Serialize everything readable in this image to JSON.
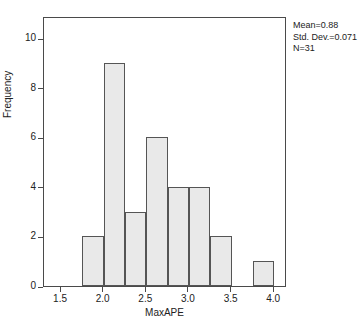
{
  "chart_data": {
    "type": "bar",
    "subtype": "histogram",
    "title": "",
    "xlabel": "MaxAPE",
    "ylabel": "Frequency",
    "xlim": [
      1.3,
      4.15
    ],
    "ylim": [
      0,
      10.9
    ],
    "grid": false,
    "bin_width": 0.25,
    "bins": [
      {
        "start": 1.75,
        "end": 2.0,
        "value": 2
      },
      {
        "start": 2.0,
        "end": 2.25,
        "value": 9
      },
      {
        "start": 2.25,
        "end": 2.5,
        "value": 3
      },
      {
        "start": 2.5,
        "end": 2.75,
        "value": 6
      },
      {
        "start": 2.75,
        "end": 3.0,
        "value": 4
      },
      {
        "start": 3.0,
        "end": 3.25,
        "value": 4
      },
      {
        "start": 3.25,
        "end": 3.5,
        "value": 2
      },
      {
        "start": 3.75,
        "end": 4.0,
        "value": 1
      }
    ],
    "categories": [
      "1.75-2.00",
      "2.00-2.25",
      "2.25-2.50",
      "2.50-2.75",
      "2.75-3.00",
      "3.00-3.25",
      "3.25-3.50",
      "3.75-4.00"
    ],
    "values": [
      2,
      9,
      3,
      6,
      4,
      4,
      2,
      1
    ],
    "xticks": [
      {
        "value": 1.5,
        "label": "1.5"
      },
      {
        "value": 2.0,
        "label": "2.0"
      },
      {
        "value": 2.5,
        "label": "2.5"
      },
      {
        "value": 3.0,
        "label": "3.0"
      },
      {
        "value": 3.5,
        "label": "3.5"
      },
      {
        "value": 4.0,
        "label": "4.0"
      }
    ],
    "yticks": [
      {
        "value": 0,
        "label": "0"
      },
      {
        "value": 2,
        "label": "2"
      },
      {
        "value": 4,
        "label": "4"
      },
      {
        "value": 6,
        "label": "6"
      },
      {
        "value": 8,
        "label": "8"
      },
      {
        "value": 10,
        "label": "10"
      }
    ],
    "annotations": {
      "mean": "Mean=0.88",
      "std_dev": "Std. Dev.=0.071",
      "n": "N=31"
    },
    "colors": {
      "bar_fill": "#e9e9e9",
      "bar_border": "#555555",
      "frame": "#4a4a4a",
      "text": "#222222",
      "background": "#ffffff"
    }
  }
}
